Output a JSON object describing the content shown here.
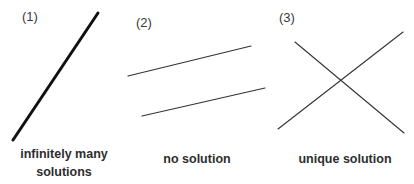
{
  "panels": [
    {
      "number": "(1)",
      "caption_line1": "infinitely many",
      "caption_line2": "solutions",
      "lines": [
        {
          "x1": 98,
          "y1": 13,
          "x2": 13,
          "y2": 140,
          "stroke": "#111111",
          "width": 3
        }
      ]
    },
    {
      "number": "(2)",
      "caption_line1": "no solution",
      "lines": [
        {
          "x1": 128,
          "y1": 76,
          "x2": 251,
          "y2": 46,
          "stroke": "#333333",
          "width": 1.2
        },
        {
          "x1": 142,
          "y1": 116,
          "x2": 265,
          "y2": 88,
          "stroke": "#333333",
          "width": 1.2
        }
      ]
    },
    {
      "number": "(3)",
      "caption_line1": "unique solution",
      "lines": [
        {
          "x1": 295,
          "y1": 42,
          "x2": 404,
          "y2": 133,
          "stroke": "#333333",
          "width": 1.1
        },
        {
          "x1": 278,
          "y1": 129,
          "x2": 403,
          "y2": 32,
          "stroke": "#333333",
          "width": 1.1
        }
      ]
    }
  ]
}
